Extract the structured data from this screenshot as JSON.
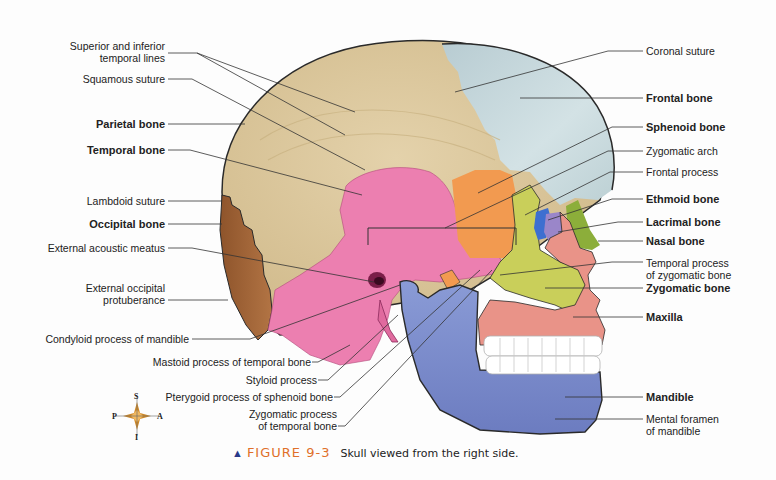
{
  "figure": {
    "number_label": "FIGURE 9-3",
    "caption": "Skull viewed from the right side.",
    "colors": {
      "parietal": "#d9c49a",
      "frontal": "#c9dbe0",
      "temporal": "#ec7fb0",
      "occipital": "#a8683a",
      "sphenoid": "#f29a50",
      "zygomatic": "#c9cf5a",
      "ethmoid": "#3d6fd0",
      "lacrimal": "#9a86c9",
      "nasal": "#8cae3a",
      "maxilla": "#e99388",
      "mandible": "#7f8fd0",
      "teeth": "#ffffff",
      "caption_accent": "#e0702a",
      "leader_line": "#333333"
    }
  },
  "labels_left": [
    {
      "id": "superior-inferior-temporal-lines",
      "text_line1": "Superior and inferior",
      "text_line2": "temporal lines",
      "bold": false
    },
    {
      "id": "squamous-suture",
      "text": "Squamous suture",
      "bold": false
    },
    {
      "id": "parietal-bone",
      "text": "Parietal bone",
      "bold": true
    },
    {
      "id": "temporal-bone",
      "text": "Temporal bone",
      "bold": true
    },
    {
      "id": "lambdoid-suture",
      "text": "Lambdoid suture",
      "bold": false
    },
    {
      "id": "occipital-bone",
      "text": "Occipital bone",
      "bold": true
    },
    {
      "id": "external-acoustic-meatus",
      "text": "External acoustic meatus",
      "bold": false
    },
    {
      "id": "external-occipital-protuberance",
      "text_line1": "External occipital",
      "text_line2": "protuberance",
      "bold": false
    },
    {
      "id": "condyloid-process",
      "text": "Condyloid process of mandible",
      "bold": false
    }
  ],
  "labels_bottom": [
    {
      "id": "mastoid-process",
      "text": "Mastoid process of temporal bone",
      "bold": false
    },
    {
      "id": "styloid-process",
      "text": "Styloid process",
      "bold": false
    },
    {
      "id": "pterygoid-process",
      "text": "Pterygoid process of sphenoid bone",
      "bold": false
    },
    {
      "id": "zygomatic-process-temporal",
      "text_line1": "Zygomatic process",
      "text_line2": "of temporal bone",
      "bold": false
    }
  ],
  "labels_right": [
    {
      "id": "coronal-suture",
      "text": "Coronal suture",
      "bold": false
    },
    {
      "id": "frontal-bone",
      "text": "Frontal bone",
      "bold": true
    },
    {
      "id": "sphenoid-bone",
      "text": "Sphenoid bone",
      "bold": true
    },
    {
      "id": "zygomatic-arch",
      "text": "Zygomatic arch",
      "bold": false
    },
    {
      "id": "frontal-process",
      "text": "Frontal process",
      "bold": false
    },
    {
      "id": "ethmoid-bone",
      "text": "Ethmoid bone",
      "bold": true
    },
    {
      "id": "lacrimal-bone",
      "text": "Lacrimal bone",
      "bold": true
    },
    {
      "id": "nasal-bone",
      "text": "Nasal bone",
      "bold": true
    },
    {
      "id": "temporal-process-zygomatic",
      "text_line1": "Temporal process",
      "text_line2": "of zygomatic bone",
      "bold": false
    },
    {
      "id": "zygomatic-bone",
      "text": "Zygomatic bone",
      "bold": true
    },
    {
      "id": "maxilla",
      "text": "Maxilla",
      "bold": true
    },
    {
      "id": "mandible",
      "text": "Mandible",
      "bold": true
    },
    {
      "id": "mental-foramen",
      "text_line1": "Mental foramen",
      "text_line2": "of mandible",
      "bold": false
    }
  ],
  "compass": {
    "superior": "S",
    "inferior": "I",
    "posterior": "P",
    "anterior": "A"
  }
}
